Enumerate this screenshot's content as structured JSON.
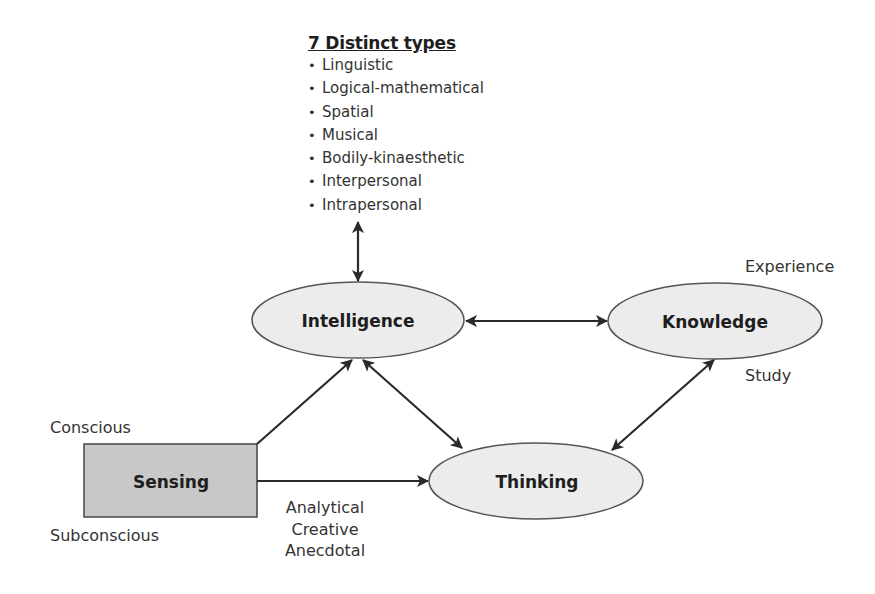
{
  "types_box": {
    "title": "7 Distinct types",
    "bullet": "•",
    "items": [
      "Linguistic",
      "Logical-mathematical",
      "Spatial",
      "Musical",
      "Bodily-kinaesthetic",
      "Interpersonal",
      "Intrapersonal"
    ]
  },
  "nodes": {
    "intelligence": "Intelligence",
    "knowledge": "Knowledge",
    "thinking": "Thinking",
    "sensing": "Sensing"
  },
  "annotations": {
    "experience": "Experience",
    "study": "Study",
    "conscious": "Conscious",
    "subconscious": "Subconscious",
    "thinking_styles": [
      "Analytical",
      "Creative",
      "Anecdotal"
    ]
  },
  "colors": {
    "ellipse_fill": "#ececec",
    "box_fill": "#c8c8c8",
    "stroke": "#444444",
    "arrow": "#2a2a2a"
  }
}
